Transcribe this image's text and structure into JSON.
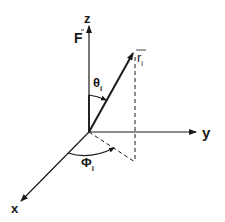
{
  "diagram": {
    "axes": {
      "z_label": "z",
      "y_label": "y",
      "x_label": "x"
    },
    "vectors": {
      "force_label": "F",
      "position_label": "r",
      "position_subscript": "i"
    },
    "angles": {
      "polar_label": "θ",
      "polar_subscript": "i",
      "azimuth_label": "Φ",
      "azimuth_subscript": "i"
    },
    "colors": {
      "ink": "#1a1a1a",
      "background": "#ffffff"
    }
  }
}
